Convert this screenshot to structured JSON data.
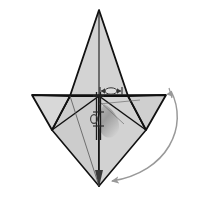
{
  "figure": {
    "background_color": "#ffffff",
    "width": 198,
    "height": 200
  },
  "palette": {
    "paper_light": "#d3d3d3",
    "paper_mid": "#c0c0c0",
    "paper_dark": "#a8a8a8",
    "paper_shadow": "#8f8f8f",
    "outline": "#111111",
    "fold_line": "#1a1a1a",
    "thin_fold": "#4a4a4a",
    "arc_arrow": "#999999",
    "annotation": "#333333"
  },
  "geometry": {
    "apex_top": {
      "x": 99,
      "y": 10
    },
    "apex_bottom": {
      "x": 99,
      "y": 186
    },
    "left_tip": {
      "x": 32,
      "y": 95
    },
    "right_tip": {
      "x": 166,
      "y": 95
    },
    "left_lower_tip": {
      "x": 52,
      "y": 130
    },
    "right_lower_tip": {
      "x": 146,
      "y": 130
    },
    "waist_left": {
      "x": 70,
      "y": 96
    },
    "waist_right": {
      "x": 128,
      "y": 96
    },
    "center": {
      "x": 99,
      "y": 96
    }
  },
  "shapes": {
    "top_spike_label": "top-triangle-spike",
    "left_wing_label": "left-wing-flap",
    "right_wing_label": "right-wing-flap",
    "bottom_cone_label": "bottom-cone-body",
    "shaded_lobe_label": "interior-shaded-lobe"
  },
  "annotations": {
    "width_marker": {
      "name": "horizontal-width-dimension",
      "x": 99,
      "y": 92,
      "half_length": 13,
      "symbol": "double-headed-arrow-with-ellipse"
    },
    "vertical_axis": {
      "name": "central-fold-axis",
      "x": 98,
      "top": 92,
      "bottom": 140,
      "style": "double-rail-with-rungs"
    },
    "rotation_arrow": {
      "name": "rotation-sweep-arrow",
      "start": {
        "x": 170,
        "y": 92
      },
      "end": {
        "x": 104,
        "y": 184
      },
      "direction": "clockwise-down-left",
      "color": "#999999"
    }
  },
  "legend": {
    "fold_axis_label": "fold axis",
    "rotation_label": "rotation",
    "width_label": "width"
  }
}
